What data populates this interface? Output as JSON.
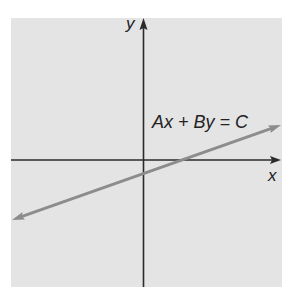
{
  "diagram": {
    "type": "coordinate-plane-line",
    "axes": {
      "x_label": "x",
      "y_label": "y"
    },
    "line": {
      "equation_label": "Ax + By = C",
      "description": "line with positive slope, crossing negative y-axis and positive x-axis, arrows at both ends"
    },
    "colors": {
      "background": "#e4e4e4",
      "axes": "#2b2b2b",
      "line": "#8c8c8c",
      "text": "#222222"
    }
  }
}
